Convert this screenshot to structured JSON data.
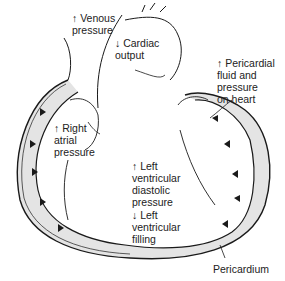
{
  "diagram": {
    "labels": {
      "venous_pressure": {
        "arrow": "↑",
        "line1": "Venous",
        "line2": "pressure"
      },
      "cardiac_output": {
        "arrow": "↓",
        "line1": "Cardiac",
        "line2": "output"
      },
      "pericardial_fluid": {
        "arrow": "↑",
        "line1": "Pericardial",
        "line2": "fluid and",
        "line3": "pressure",
        "line4": "on heart"
      },
      "right_atrial": {
        "arrow": "↑",
        "line1": "Right",
        "line2": "atrial",
        "line3": "pressure"
      },
      "lv_diastolic": {
        "arrow": "↑",
        "line1": "Left",
        "line2": "ventricular",
        "line3": "diastolic",
        "line4": "pressure"
      },
      "lv_filling": {
        "arrow": "↓",
        "line1": "Left",
        "line2": "ventricular",
        "line3": "filling"
      },
      "pericardium": {
        "line1": "Pericardium"
      }
    },
    "colors": {
      "line": "#1a1a1a",
      "fluid": "#e4e4e4",
      "background": "#ffffff"
    }
  }
}
